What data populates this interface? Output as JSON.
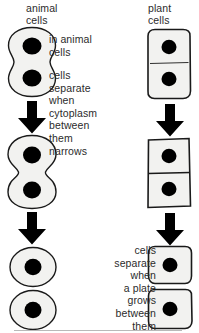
{
  "diagram": {
    "columns": {
      "animal": {
        "heading": "animal\ncells",
        "caption_a": "in animal\ncells",
        "caption_b": "cells\nseparate\nwhen\ncytoplasm\nbetween\nthem\nnarrows",
        "stages": [
          {
            "name": "dumbbell-cell-early",
            "label": "cell with two nuclei beginning to pinch",
            "nuclei": 2
          },
          {
            "name": "dumbbell-cell-constricted",
            "label": "cell with deep cleavage furrow",
            "nuclei": 2
          },
          {
            "name": "daughter-cell-top",
            "label": "separated round daughter cell",
            "nuclei": 1
          },
          {
            "name": "daughter-cell-bottom",
            "label": "separated round daughter cell",
            "nuclei": 1
          }
        ],
        "arrows": 2
      },
      "plant": {
        "heading": "plant\ncells",
        "caption": "cells\nseparate\nwhen\na plate\ngrows\nbetween\nthem",
        "stages": [
          {
            "name": "plant-cell-forming-plate",
            "label": "rectangular cell with forming cell plate",
            "nuclei": 2
          },
          {
            "name": "plant-cell-complete-plate",
            "label": "rectangular cell with complete cell plate",
            "nuclei": 2
          },
          {
            "name": "plant-daughter-cell-top",
            "label": "separated plant daughter cell",
            "nuclei": 1
          },
          {
            "name": "plant-daughter-cell-bottom",
            "label": "separated plant daughter cell",
            "nuclei": 1
          }
        ],
        "arrows": 2
      }
    },
    "colors": {
      "ink": "#1a1a1a",
      "text": "#2b2b2b",
      "cytoplasm": "#f2f2f0",
      "nucleus": "#000000",
      "membrane": "#1a1a1a",
      "rule": "#b9b9b9"
    }
  }
}
